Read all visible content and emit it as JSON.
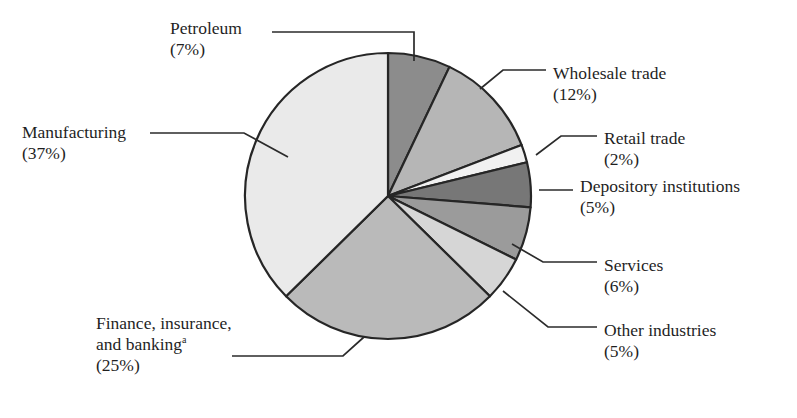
{
  "figure": {
    "title_partial": "",
    "footnote_marker": "a"
  },
  "chart_data": {
    "type": "pie",
    "title": "",
    "xlabel": "",
    "ylabel": "",
    "legend_position": "callout-labels",
    "grid": false,
    "start_angle_deg": 0,
    "direction": "clockwise",
    "categories": [
      "Petroleum",
      "Wholesale trade",
      "Retail trade",
      "Depository institutions",
      "Services",
      "Other industries",
      "Finance, insurance, and banking",
      "Manufacturing"
    ],
    "values": [
      7,
      12,
      2,
      5,
      6,
      5,
      25,
      37
    ],
    "slices": [
      {
        "name": "Petroleum",
        "label": "Petroleum",
        "percent_text": "(7%)",
        "value": 7,
        "color": "#8c8c8c"
      },
      {
        "name": "Wholesale trade",
        "label": "Wholesale trade",
        "percent_text": "(12%)",
        "value": 12,
        "color": "#b6b6b6"
      },
      {
        "name": "Retail trade",
        "label": "Retail trade",
        "percent_text": "(2%)",
        "value": 2,
        "color": "#f1f1f1"
      },
      {
        "name": "Depository institutions",
        "label": "Depository institutions",
        "percent_text": "(5%)",
        "value": 5,
        "color": "#777777"
      },
      {
        "name": "Services",
        "label": "Services",
        "percent_text": "(6%)",
        "value": 6,
        "color": "#9b9b9b"
      },
      {
        "name": "Other industries",
        "label": "Other industries",
        "percent_text": "(5%)",
        "value": 5,
        "color": "#d6d6d6"
      },
      {
        "name": "Finance, insurance, and banking",
        "label": "Finance, insurance,",
        "label_line2": "and banking",
        "percent_text": "(25%)",
        "value": 25,
        "color": "#bababa"
      },
      {
        "name": "Manufacturing",
        "label": "Manufacturing",
        "percent_text": "(37%)",
        "value": 37,
        "color": "#eaeaea"
      }
    ],
    "outline_color": "#262626"
  }
}
